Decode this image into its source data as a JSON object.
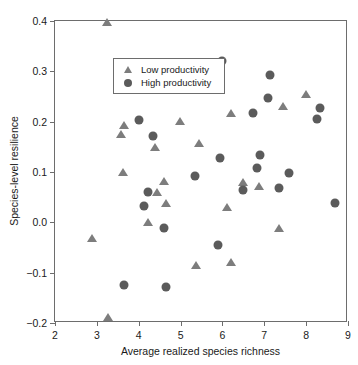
{
  "chart_data": {
    "type": "scatter",
    "title": "",
    "xlabel": "Average realized species richness",
    "ylabel": "Species-level resilience",
    "xlim": [
      2,
      9
    ],
    "ylim": [
      -0.2,
      0.4
    ],
    "xticks": [
      "2",
      "3",
      "4",
      "5",
      "6",
      "7",
      "8",
      "9"
    ],
    "xtick_values": [
      2,
      3,
      4,
      5,
      6,
      7,
      8,
      9
    ],
    "yticks": [
      "0.4",
      "0.3",
      "0.2",
      "0.1",
      "0.0",
      "−0.1",
      "−0.2"
    ],
    "ytick_values": [
      0.4,
      0.3,
      0.2,
      0.1,
      0.0,
      -0.1,
      -0.2
    ],
    "grid": false,
    "legend_position": "top-left",
    "series": [
      {
        "name": "Low productivity",
        "marker": "triangle",
        "color": "#7d7d7d",
        "points": [
          [
            3.25,
            0.398
          ],
          [
            2.88,
            -0.031
          ],
          [
            3.27,
            -0.188
          ],
          [
            3.57,
            0.176
          ],
          [
            3.64,
            0.193
          ],
          [
            3.63,
            0.1
          ],
          [
            4.22,
            0.0
          ],
          [
            4.38,
            0.15
          ],
          [
            4.43,
            0.06
          ],
          [
            4.6,
            0.082
          ],
          [
            4.64,
            0.039
          ],
          [
            4.99,
            0.201
          ],
          [
            5.36,
            -0.085
          ],
          [
            5.44,
            0.158
          ],
          [
            6.12,
            0.031
          ],
          [
            6.2,
            -0.078
          ],
          [
            6.2,
            0.217
          ],
          [
            6.49,
            0.08
          ],
          [
            6.88,
            0.073
          ],
          [
            7.36,
            -0.011
          ],
          [
            7.45,
            0.231
          ],
          [
            7.99,
            0.254
          ]
        ]
      },
      {
        "name": "High productivity",
        "marker": "circle",
        "color": "#5b5b5b",
        "points": [
          [
            3.66,
            -0.125
          ],
          [
            4.01,
            0.203
          ],
          [
            4.13,
            0.033
          ],
          [
            4.22,
            0.06
          ],
          [
            4.34,
            0.172
          ],
          [
            4.6,
            -0.012
          ],
          [
            4.64,
            -0.129
          ],
          [
            4.73,
            0.274
          ],
          [
            5.35,
            0.093
          ],
          [
            5.9,
            -0.045
          ],
          [
            5.95,
            0.127
          ],
          [
            5.99,
            0.321
          ],
          [
            6.48,
            0.065
          ],
          [
            6.73,
            0.217
          ],
          [
            6.83,
            0.108
          ],
          [
            6.9,
            0.134
          ],
          [
            7.08,
            0.247
          ],
          [
            7.14,
            0.292
          ],
          [
            7.36,
            0.068
          ],
          [
            7.6,
            0.098
          ],
          [
            8.27,
            0.205
          ],
          [
            8.34,
            0.228
          ],
          [
            8.68,
            0.038
          ]
        ]
      }
    ]
  },
  "legend": {
    "items": [
      {
        "label": "Low productivity",
        "marker": "triangle"
      },
      {
        "label": "High productivity",
        "marker": "circle"
      }
    ]
  }
}
